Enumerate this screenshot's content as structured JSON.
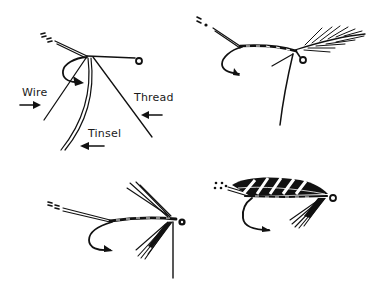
{
  "diagram": {
    "type": "illustration",
    "ink_color": "#111111",
    "background": "#ffffff",
    "panels": [
      {
        "id": "step-1",
        "position": "top-left",
        "labels": [
          {
            "text": "Wire",
            "arrow": "right"
          },
          {
            "text": "Thread",
            "arrow": "left"
          },
          {
            "text": "Tinsel",
            "arrow": "left"
          }
        ]
      },
      {
        "id": "step-2",
        "position": "top-right",
        "labels": []
      },
      {
        "id": "step-3",
        "position": "bottom-left",
        "labels": []
      },
      {
        "id": "step-4",
        "position": "bottom-right",
        "labels": []
      }
    ]
  }
}
